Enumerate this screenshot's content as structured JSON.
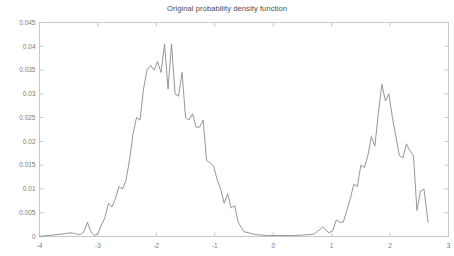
{
  "chart_data": {
    "type": "line",
    "title": "Original probability density function",
    "xlabel": "",
    "ylabel": "",
    "xlim": [
      -4,
      3
    ],
    "ylim": [
      0,
      0.045
    ],
    "grid": false,
    "legend": null,
    "xticks": [
      -4,
      -3,
      -2,
      -1,
      0,
      1,
      2,
      3
    ],
    "xtick_labels": [
      "-4",
      "-3",
      "-2",
      "-1",
      "0",
      "1",
      "2",
      "3"
    ],
    "yticks": [
      0,
      0.005,
      0.01,
      0.015,
      0.02,
      0.025,
      0.03,
      0.035,
      0.04,
      0.045
    ],
    "ytick_labels": [
      "0",
      "0.005",
      "0.01",
      "0.015",
      "0.02",
      "0.025",
      "0.03",
      "0.035",
      "0.04",
      "0.045"
    ],
    "line_color": "#8a8a8a",
    "axis_color": "#c8c8c8",
    "series": [
      {
        "name": "density",
        "x": [
          -3.55,
          -3.48,
          -3.42,
          -3.36,
          -3.3,
          -3.24,
          -3.18,
          -3.12,
          -3.06,
          -3.0,
          -2.94,
          -2.88,
          -2.82,
          -2.76,
          -2.7,
          -2.64,
          -2.58,
          -2.52,
          -2.46,
          -2.4,
          -2.34,
          -2.28,
          -2.22,
          -2.16,
          -2.1,
          -2.04,
          -1.98,
          -1.92,
          -1.86,
          -1.8,
          -1.74,
          -1.68,
          -1.62,
          -1.56,
          -1.5,
          -1.44,
          -1.38,
          -1.32,
          -1.26,
          -1.2,
          -1.14,
          -1.08,
          -1.02,
          -0.96,
          -0.9,
          -0.84,
          -0.78,
          -0.72,
          -0.66,
          -0.6,
          -0.5,
          -0.3,
          -0.1,
          0.1,
          0.3,
          0.5,
          0.7,
          0.85,
          0.95,
          1.02,
          1.08,
          1.14,
          1.2,
          1.26,
          1.32,
          1.38,
          1.44,
          1.5,
          1.56,
          1.62,
          1.68,
          1.74,
          1.8,
          1.86,
          1.92,
          1.98,
          2.04,
          2.1,
          2.16,
          2.22,
          2.28,
          2.34,
          2.4,
          2.46,
          2.52,
          2.58,
          2.65
        ],
        "y": [
          0.0006,
          0.0008,
          0.0007,
          0.0005,
          0.0004,
          0.001,
          0.003,
          0.001,
          0.0002,
          0.0006,
          0.0024,
          0.004,
          0.007,
          0.0062,
          0.008,
          0.0105,
          0.01,
          0.0118,
          0.016,
          0.0215,
          0.025,
          0.0245,
          0.031,
          0.035,
          0.036,
          0.035,
          0.0368,
          0.0345,
          0.0405,
          0.031,
          0.0405,
          0.03,
          0.0295,
          0.0345,
          0.025,
          0.0245,
          0.0258,
          0.023,
          0.023,
          0.0245,
          0.016,
          0.0155,
          0.0148,
          0.012,
          0.01,
          0.007,
          0.009,
          0.006,
          0.0065,
          0.003,
          0.001,
          0.0004,
          0.0002,
          0.0002,
          0.0002,
          0.0003,
          0.0005,
          0.002,
          0.0008,
          0.0012,
          0.0035,
          0.003,
          0.003,
          0.0055,
          0.008,
          0.011,
          0.0105,
          0.015,
          0.0145,
          0.017,
          0.021,
          0.019,
          0.026,
          0.032,
          0.0285,
          0.03,
          0.025,
          0.021,
          0.017,
          0.0165,
          0.0195,
          0.018,
          0.017,
          0.0055,
          0.0095,
          0.01,
          0.003
        ]
      }
    ]
  }
}
